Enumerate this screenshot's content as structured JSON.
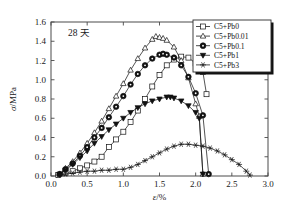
{
  "figure": {
    "annotation": "28 天",
    "background": "#ffffff",
    "line_color": "#1b1b1b"
  },
  "axes": {
    "x": {
      "label_symbol": "ε",
      "label_unit": "/%",
      "label_full": "ε/%",
      "min": 0.0,
      "max": 3.0,
      "ticks": [
        0.0,
        0.5,
        1.0,
        1.5,
        2.0,
        2.5,
        3.0
      ],
      "tick_labels": [
        "0.0",
        "0.5",
        "1.0",
        "1.5",
        "2.0",
        "2.5",
        "3.0"
      ]
    },
    "y": {
      "label_symbol": "σ",
      "label_unit": "/MPa",
      "label_full": "σ/MPa",
      "min": 0.0,
      "max": 1.6,
      "ticks": [
        0.0,
        0.2,
        0.4,
        0.6,
        0.8,
        1.0,
        1.2,
        1.4,
        1.6
      ],
      "tick_labels": [
        "0.0",
        "0.2",
        "0.4",
        "0.6",
        "0.8",
        "1.0",
        "1.2",
        "1.4",
        "1.6"
      ]
    }
  },
  "legend": {
    "position": "top-right",
    "entries": [
      {
        "label": "C5+Pb0",
        "marker": "square-open"
      },
      {
        "label": "C5+Pb0.01",
        "marker": "triangle-up-open"
      },
      {
        "label": "C5+Pb0.1",
        "marker": "circle-filled"
      },
      {
        "label": "C5+Pb1",
        "marker": "triangle-down-filled"
      },
      {
        "label": "C5+Pb3",
        "marker": "asterisk"
      }
    ]
  },
  "chart_data": {
    "type": "line",
    "title": "",
    "subtitle": "",
    "annotation": "28 天",
    "xlabel": "ε/%",
    "ylabel": "σ/MPa",
    "xlim": [
      0.0,
      3.0
    ],
    "ylim": [
      0.0,
      1.6
    ],
    "grid": false,
    "legend_position": "top-right",
    "series": [
      {
        "name": "C5+Pb0",
        "marker": "square-open",
        "x": [
          0.1,
          0.2,
          0.3,
          0.4,
          0.5,
          0.6,
          0.7,
          0.8,
          0.9,
          1.0,
          1.1,
          1.2,
          1.3,
          1.4,
          1.5,
          1.6,
          1.7,
          1.8,
          1.9,
          2.0,
          2.1,
          2.15
        ],
        "y": [
          0.01,
          0.03,
          0.05,
          0.08,
          0.11,
          0.15,
          0.2,
          0.3,
          0.38,
          0.46,
          0.56,
          0.68,
          0.8,
          0.93,
          1.05,
          1.15,
          1.21,
          1.24,
          1.23,
          1.17,
          1.08,
          0.85
        ]
      },
      {
        "name": "C5+Pb0.01",
        "marker": "triangle-up-open",
        "x": [
          0.12,
          0.2,
          0.3,
          0.4,
          0.5,
          0.6,
          0.7,
          0.8,
          0.9,
          1.0,
          1.1,
          1.2,
          1.3,
          1.4,
          1.45,
          1.5,
          1.55,
          1.6,
          1.7,
          1.8,
          1.9,
          2.0,
          2.05,
          2.1
        ],
        "y": [
          0.02,
          0.08,
          0.15,
          0.24,
          0.34,
          0.45,
          0.57,
          0.7,
          0.83,
          0.96,
          1.1,
          1.22,
          1.33,
          1.42,
          1.45,
          1.44,
          1.43,
          1.41,
          1.34,
          1.2,
          1.02,
          0.75,
          0.62,
          0.02
        ]
      },
      {
        "name": "C5+Pb0.1",
        "marker": "circle-filled",
        "x": [
          0.12,
          0.2,
          0.3,
          0.4,
          0.5,
          0.6,
          0.7,
          0.8,
          0.9,
          1.0,
          1.1,
          1.2,
          1.3,
          1.4,
          1.5,
          1.55,
          1.6,
          1.7,
          1.8,
          1.9,
          2.0,
          2.1,
          2.18
        ],
        "y": [
          0.02,
          0.07,
          0.13,
          0.21,
          0.3,
          0.4,
          0.5,
          0.61,
          0.72,
          0.83,
          0.95,
          1.06,
          1.15,
          1.22,
          1.26,
          1.27,
          1.26,
          1.23,
          1.15,
          1.03,
          0.86,
          0.63,
          0.02
        ]
      },
      {
        "name": "C5+Pb1",
        "marker": "triangle-down-filled",
        "x": [
          0.12,
          0.2,
          0.3,
          0.4,
          0.5,
          0.6,
          0.7,
          0.8,
          0.9,
          1.0,
          1.1,
          1.2,
          1.3,
          1.4,
          1.5,
          1.6,
          1.65,
          1.7,
          1.8,
          1.9,
          2.0,
          2.05,
          2.1
        ],
        "y": [
          0.02,
          0.06,
          0.12,
          0.19,
          0.26,
          0.34,
          0.41,
          0.48,
          0.54,
          0.6,
          0.66,
          0.71,
          0.75,
          0.78,
          0.8,
          0.82,
          0.82,
          0.81,
          0.78,
          0.73,
          0.66,
          0.6,
          0.02
        ]
      },
      {
        "name": "C5+Pb3",
        "marker": "asterisk",
        "x": [
          0.1,
          0.2,
          0.3,
          0.4,
          0.5,
          0.6,
          0.7,
          0.8,
          0.9,
          1.0,
          1.1,
          1.2,
          1.3,
          1.4,
          1.5,
          1.6,
          1.7,
          1.8,
          1.9,
          2.0,
          2.1,
          2.2,
          2.3,
          2.4,
          2.5,
          2.6,
          2.7,
          2.75
        ],
        "y": [
          0.01,
          0.02,
          0.03,
          0.04,
          0.05,
          0.05,
          0.06,
          0.06,
          0.07,
          0.07,
          0.09,
          0.12,
          0.16,
          0.2,
          0.24,
          0.28,
          0.31,
          0.33,
          0.33,
          0.32,
          0.31,
          0.29,
          0.26,
          0.22,
          0.17,
          0.12,
          0.05,
          0.01
        ]
      }
    ]
  }
}
